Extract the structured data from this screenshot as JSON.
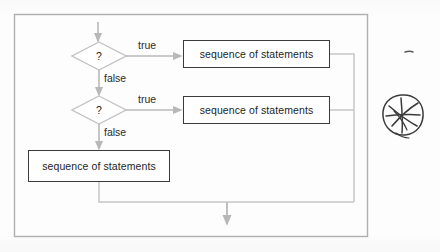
{
  "figure": {
    "background_color": "#fdfdfd",
    "frame_color": "#b0b0b0",
    "connector_color": "#b8b8b8",
    "box_border_color": "#3a3a3a",
    "text_color": "#1d1d1d"
  },
  "nodes": {
    "decision1": {
      "label": "?"
    },
    "decision2": {
      "label": "?"
    },
    "process1": {
      "label": "sequence of statements"
    },
    "process2": {
      "label": "sequence of statements"
    },
    "process3": {
      "label": "sequence of statements"
    }
  },
  "edges": {
    "d1_true": {
      "label": "true"
    },
    "d1_false": {
      "label": "false"
    },
    "d2_true": {
      "label": "true"
    },
    "d2_false": {
      "label": "false"
    }
  },
  "annotation": {
    "scribble": "circled-crossed-star-scribble",
    "tick_mark": "small-pen-tick"
  }
}
